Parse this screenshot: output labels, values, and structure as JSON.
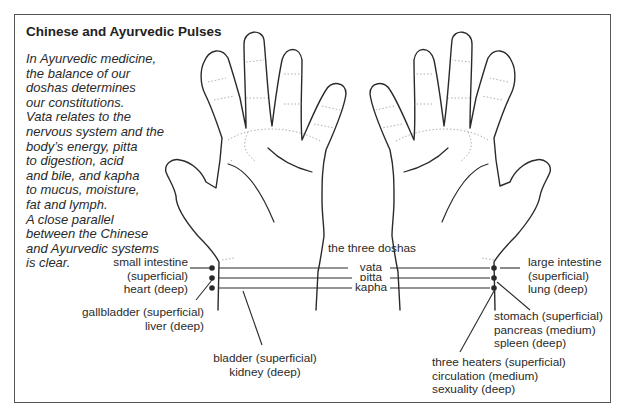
{
  "title": "Chinese and Ayurvedic Pulses",
  "intro_lines": [
    "In Ayurvedic medicine,",
    "the balance of our",
    "doshas determines",
    "our constitutions.",
    "Vata relates to the",
    "nervous system and the",
    "body’s energy, pitta",
    "to digestion, acid",
    "and bile, and kapha",
    "to mucus, moisture,",
    "fat and lymph.",
    "A close parallel",
    "between the Chinese",
    "and Ayurvedic systems",
    "is clear."
  ],
  "doshas": {
    "heading": "the three doshas",
    "items": [
      "vata",
      "pitta",
      "kapha"
    ]
  },
  "left_hand_labels": {
    "top": [
      "small intestine",
      "(superficial)",
      "heart (deep)"
    ],
    "middle": [
      "gallbladder (superficial)",
      "liver (deep)"
    ],
    "bottom": [
      "bladder (superficial)",
      "kidney (deep)"
    ]
  },
  "right_hand_labels": {
    "top": [
      "large intestine",
      "(superficial)",
      "lung (deep)"
    ],
    "middle": [
      "stomach (superficial)",
      "pancreas (medium)",
      "spleen (deep)"
    ],
    "bottom": [
      "three heaters (superficial)",
      "circulation (medium)",
      "sexuality (deep)"
    ]
  },
  "colors": {
    "outline": "#2a2a2a",
    "crease": "#9a9a9a",
    "frame": "#555555",
    "text": "#2a2a2a"
  }
}
